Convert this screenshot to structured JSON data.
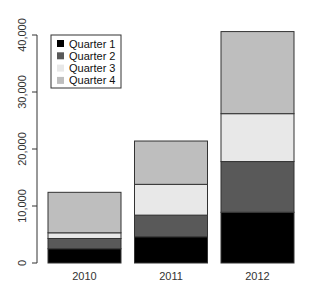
{
  "chart_data": {
    "type": "bar",
    "stacked": true,
    "title": "",
    "xlabel": "",
    "ylabel": "",
    "categories": [
      "2010",
      "2011",
      "2012"
    ],
    "series": [
      {
        "name": "Quarter 1",
        "color": "#000000",
        "values": [
          2500,
          4600,
          8900
        ]
      },
      {
        "name": "Quarter 2",
        "color": "#595959",
        "values": [
          1800,
          3800,
          8900
        ]
      },
      {
        "name": "Quarter 3",
        "color": "#e8e8e8",
        "values": [
          1000,
          5400,
          8400
        ]
      },
      {
        "name": "Quarter 4",
        "color": "#bebebe",
        "values": [
          7100,
          7600,
          14400
        ]
      }
    ],
    "ylim": [
      0,
      40000
    ],
    "yticks": [
      0,
      10000,
      20000,
      30000,
      40000
    ],
    "ytick_labels": [
      "0",
      "10,000",
      "20,000",
      "30,000",
      "40,000"
    ],
    "grid": false,
    "legend_position": "top-left"
  }
}
